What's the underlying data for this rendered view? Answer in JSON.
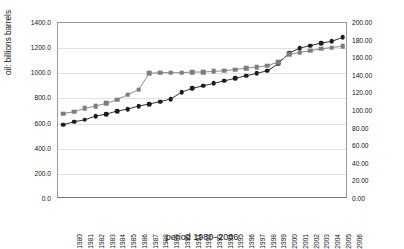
{
  "chart_data": {
    "type": "line",
    "title": "",
    "xlabel": "period 1980–2006",
    "ylabel": "oil: billions barrels",
    "y2label": "natural gas: trillions m^3",
    "grid": true,
    "legend_position": "none",
    "ylim": [
      0,
      1400
    ],
    "y2lim": [
      0,
      200
    ],
    "yticks": [
      "0.0",
      "200.0",
      "400.0",
      "600.0",
      "800.0",
      "1000.0",
      "1200.0",
      "1400.0"
    ],
    "y2ticks": [
      "0.00",
      "20.00",
      "40.00",
      "60.00",
      "80.00",
      "100.00",
      "120.00",
      "140.00",
      "160.00",
      "180.00",
      "200.00"
    ],
    "categories": [
      "1980",
      "1981",
      "1982",
      "1983",
      "1984",
      "1985",
      "1986",
      "1987",
      "1988",
      "1989",
      "1990",
      "1991",
      "1992",
      "1993",
      "1994",
      "1995",
      "1996",
      "1997",
      "1998",
      "1999",
      "2000",
      "2001",
      "2002",
      "2003",
      "2004",
      "2005",
      "2006"
    ],
    "series": [
      {
        "name": "oil: billions barrels",
        "marker": "circle",
        "color": "#1c1c1c",
        "axis": "left",
        "values": [
          590,
          615,
          630,
          660,
          675,
          700,
          715,
          740,
          755,
          775,
          795,
          850,
          880,
          900,
          920,
          940,
          960,
          980,
          1000,
          1020,
          1075,
          1160,
          1200,
          1220,
          1240,
          1255,
          1285
        ]
      },
      {
        "name": "natural gas: trillions m^3",
        "marker": "square",
        "color": "#7d7d7d",
        "axis": "right",
        "values": [
          680,
          695,
          720,
          740,
          760,
          790,
          830,
          870,
          1000,
          1005,
          1005,
          1005,
          1010,
          1010,
          1015,
          1020,
          1030,
          1040,
          1050,
          1060,
          1090,
          1150,
          1165,
          1180,
          1195,
          1205,
          1215
        ]
      }
    ]
  }
}
